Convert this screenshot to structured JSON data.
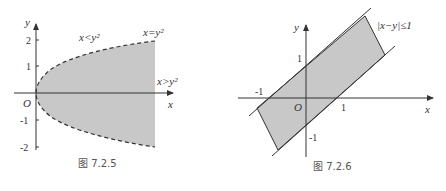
{
  "figures": [
    {
      "caption": "图 7.2.5",
      "axis_x_label": "x",
      "axis_y_label": "y",
      "origin_label": "O",
      "y_ticks": [
        "2",
        "1",
        "-1",
        "-2"
      ],
      "region_label_outside": "x<y²",
      "curve_label": "x=y²",
      "region_label_inside": "x>y²"
    },
    {
      "caption": "图 7.2.6",
      "axis_x_label": "x",
      "axis_y_label": "y",
      "origin_label": "O",
      "x_ticks": [
        "-1",
        "1"
      ],
      "y_ticks": [
        "1",
        "-1"
      ],
      "region_label": "|x−y|≤1"
    }
  ],
  "colors": {
    "region_fill": "#c8c8c8",
    "axis": "#333333",
    "boundary": "#333333"
  }
}
